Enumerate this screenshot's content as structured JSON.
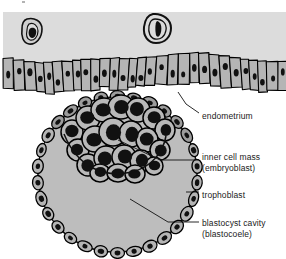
{
  "figure": {
    "type": "biological-diagram",
    "background_color": "#ffffff",
    "lumen_color": "#dcdcdc",
    "cell_fill_color": "#b5b5b5",
    "cavity_color": "#bdbdbd",
    "nucleus_color": "#111111",
    "outline_color": "#000000"
  },
  "labels": {
    "endometrium": "endometrium",
    "inner_cell_mass_line1": "inner cell mass",
    "inner_cell_mass_line2": "(embryoblast)",
    "trophoblast": "trophoblast",
    "blastocyst_cavity_line1": "blastocyst cavity",
    "blastocyst_cavity_line2": "(blastocoele)"
  },
  "structures": {
    "uterine_lumen": "uterine-lumen",
    "epithelium": "endometrial-epithelium",
    "free_cells_count": 2,
    "blastocyst": "blastocyst",
    "inner_cell_mass": "inner-cell-mass",
    "trophoblast_ring": "trophoblast-ring",
    "blastocyst_cavity": "blastocyst-cavity"
  }
}
